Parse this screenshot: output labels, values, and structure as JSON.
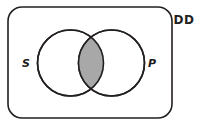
{
  "figure": {
    "type": "venn-diagram",
    "title": "",
    "universe": {
      "label": "DD",
      "shape": "rounded-rectangle",
      "x": 8,
      "y": 7,
      "width": 164,
      "height": 111,
      "corner_radius": 14,
      "stroke_color": "#231f20",
      "stroke_width": 1.6,
      "fill_color": "#ffffff",
      "label_x": 184,
      "label_y": 24
    },
    "sets": [
      {
        "label": "S",
        "name": "subject-set",
        "cx": 70.5,
        "cy": 63,
        "r": 33,
        "stroke_color": "#231f20",
        "stroke_width": 1.6,
        "fill_color": "#ffffff",
        "label_x": 26,
        "label_y": 67
      },
      {
        "label": "P",
        "name": "predicate-set",
        "cx": 111.5,
        "cy": 63,
        "r": 33,
        "stroke_color": "#231f20",
        "stroke_width": 1.6,
        "fill_color": "#ffffff",
        "label_x": 152,
        "label_y": 67
      }
    ],
    "intersection": {
      "name": "s-and-p-intersection",
      "shaded": true,
      "fill_color": "#a8a8a8",
      "stroke_color": "#231f20"
    }
  }
}
